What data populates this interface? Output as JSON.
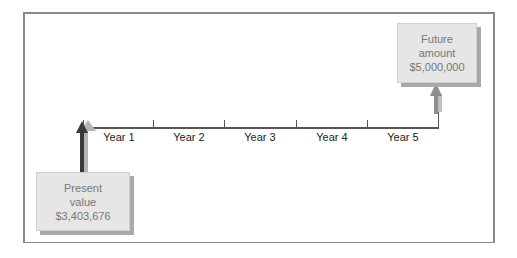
{
  "diagram": {
    "type": "timeline",
    "timeline": {
      "periods": [
        "Year 1",
        "Year 2",
        "Year 3",
        "Year 4",
        "Year 5"
      ]
    },
    "present": {
      "line1": "Present",
      "line2": "value",
      "amount": "$3,403,676"
    },
    "future": {
      "line1": "Future",
      "line2": "amount",
      "amount": "$5,000,000"
    },
    "colors": {
      "present_arrow": "#3a3a3a",
      "future_arrow": "#9a9a9a",
      "box_fill": "#e6e6e6",
      "box_shadow": "#a9a9a9",
      "frame": "#8a8a8a"
    }
  }
}
